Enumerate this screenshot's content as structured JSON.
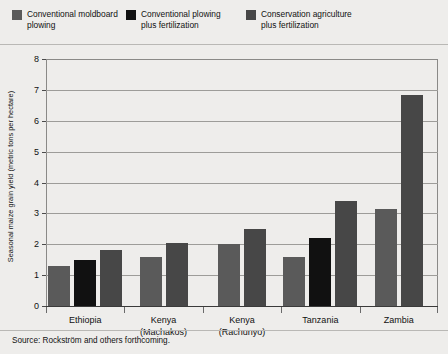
{
  "figure": {
    "background_color": "#eeedeb",
    "source_note": "Source: Rockström and others forthcoming."
  },
  "legend": {
    "items": [
      {
        "label": "Conventional moldboard\nplowing",
        "color": "#5a5a5a",
        "name": "legend-conventional-moldboard-plowing"
      },
      {
        "label": "Conventional plowing\nplus fertilization",
        "color": "#111111",
        "name": "legend-conventional-plowing-plus-fertilization"
      },
      {
        "label": "Conservation agriculture\nplus fertilization",
        "color": "#474747",
        "name": "legend-conservation-agriculture-plus-fertilization"
      }
    ]
  },
  "chart_data": {
    "type": "bar",
    "title": "",
    "xlabel": "",
    "ylabel": "Seasonal maize grain yield (metric tons per hectare)",
    "ylim": [
      0,
      8
    ],
    "yticks": [
      0,
      1,
      2,
      3,
      4,
      5,
      6,
      7,
      8
    ],
    "ytick_labels": [
      "0",
      "1",
      "2",
      "3",
      "4",
      "5",
      "6",
      "7",
      "8"
    ],
    "grid": true,
    "grid_axis": "y",
    "legend_position": "above-plot",
    "categories": [
      "Ethiopia",
      "Kenya\n(Machakos)",
      "Kenya\n(Rachunyo)",
      "Tanzania",
      "Zambia"
    ],
    "series": [
      {
        "name": "Conventional moldboard plowing",
        "color": "#5a5a5a",
        "values": [
          1.3,
          1.6,
          2.0,
          1.6,
          3.15
        ]
      },
      {
        "name": "Conventional plowing plus fertilization",
        "color": "#111111",
        "values": [
          1.5,
          null,
          null,
          2.2,
          null
        ]
      },
      {
        "name": "Conservation agriculture plus fertilization",
        "color": "#474747",
        "values": [
          1.8,
          2.05,
          2.5,
          3.4,
          6.85
        ]
      }
    ]
  }
}
